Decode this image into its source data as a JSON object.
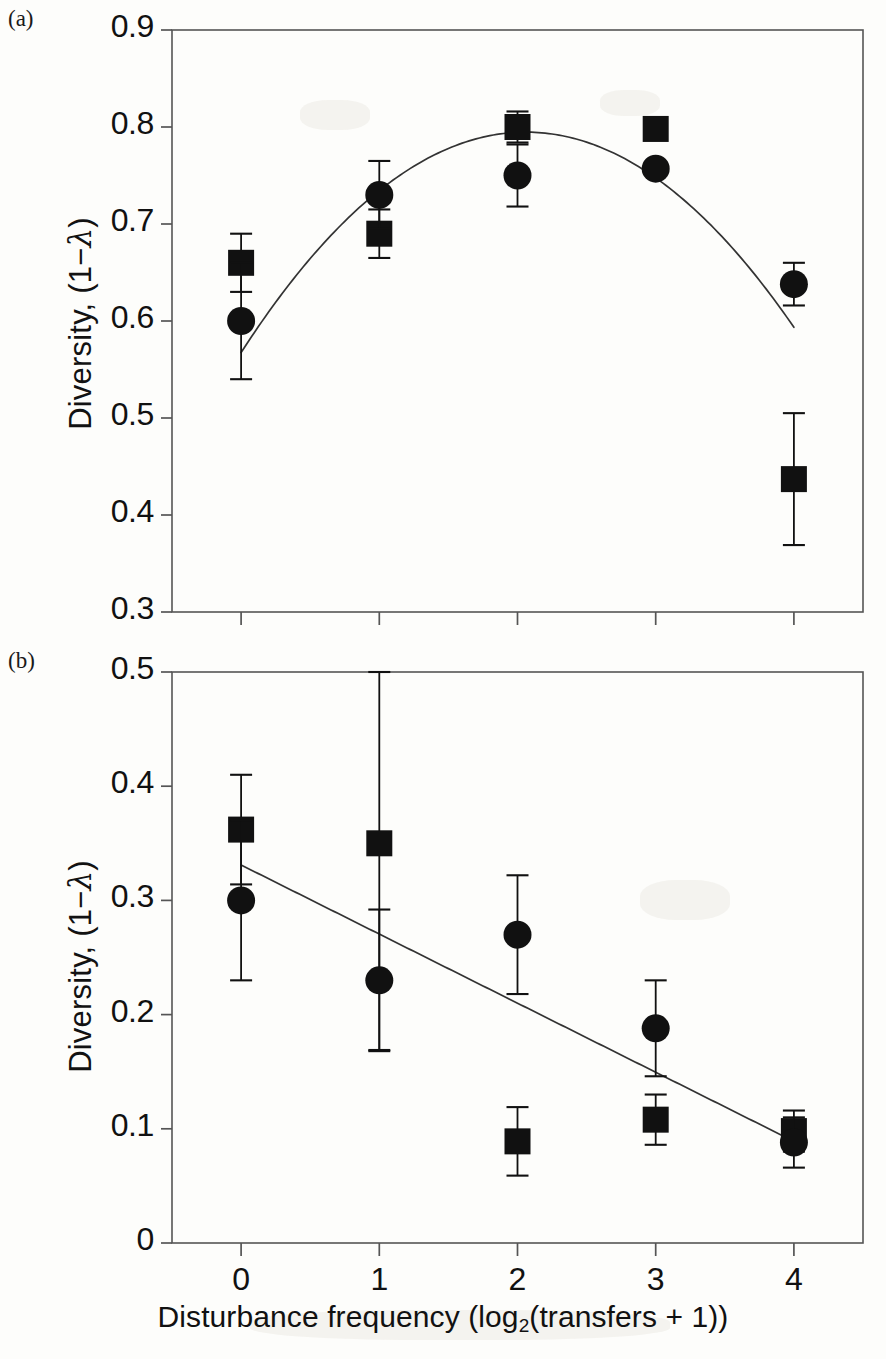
{
  "figure": {
    "panel_a_tag": "(a)",
    "panel_b_tag": "(b)",
    "xlabel_prefix": "Disturbance frequency (log",
    "xlabel_sub": "2",
    "xlabel_suffix": "(transfers + 1))",
    "ylabel_prefix": "Diversity, (1−",
    "ylabel_lambda": "λ",
    "ylabel_suffix": ")",
    "marker_colors": {
      "ink": "#111111",
      "axis": "#555555",
      "fit": "#333333"
    }
  },
  "chart_data": [
    {
      "type": "scatter",
      "panel": "(a)",
      "title": "",
      "xlabel": "Disturbance frequency (log2(transfers + 1))",
      "ylabel": "Diversity, (1−λ)",
      "xlim": [
        -0.5,
        4.5
      ],
      "ylim": [
        0.3,
        0.9
      ],
      "xticks": [
        0,
        1,
        2,
        3,
        4
      ],
      "xtick_labels": [
        "0",
        "1",
        "2",
        "3",
        "4"
      ],
      "yticks": [
        0.3,
        0.4,
        0.5,
        0.6,
        0.7,
        0.8,
        0.9
      ],
      "ytick_labels": [
        "0.3",
        "0.4",
        "0.5",
        "0.6",
        "0.7",
        "0.8",
        "0.9"
      ],
      "grid": false,
      "legend": "none",
      "x": [
        0,
        1,
        2,
        3,
        4
      ],
      "series": [
        {
          "name": "square",
          "marker": "square",
          "values": [
            0.66,
            0.69,
            0.8,
            0.798,
            0.437
          ],
          "err": [
            0.03,
            0.025,
            0.016,
            0.006,
            0.068
          ]
        },
        {
          "name": "circle",
          "marker": "circle",
          "values": [
            0.6,
            0.73,
            0.75,
            0.757,
            0.638
          ],
          "err": [
            0.06,
            0.035,
            0.032,
            0.006,
            0.022
          ]
        }
      ],
      "fit": {
        "kind": "quadratic",
        "equation": "y = 0.5675 + 0.2205x - 0.0535x^2",
        "a": -0.0535,
        "b": 0.2205,
        "c": 0.5675,
        "x_start": 0.0,
        "x_end": 4.0
      }
    },
    {
      "type": "scatter",
      "panel": "(b)",
      "title": "",
      "xlabel": "Disturbance frequency (log2(transfers + 1))",
      "ylabel": "Diversity, (1−λ)",
      "xlim": [
        -0.5,
        4.5
      ],
      "ylim": [
        0.0,
        0.5
      ],
      "xticks": [
        0,
        1,
        2,
        3,
        4
      ],
      "xtick_labels": [
        "0",
        "1",
        "2",
        "3",
        "4"
      ],
      "yticks": [
        0.0,
        0.1,
        0.2,
        0.3,
        0.4,
        0.5
      ],
      "ytick_labels": [
        "0",
        "0.1",
        "0.2",
        "0.3",
        "0.4",
        "0.5"
      ],
      "grid": false,
      "legend": "none",
      "x": [
        0,
        1,
        2,
        3,
        4
      ],
      "series": [
        {
          "name": "square",
          "marker": "square",
          "values": [
            0.362,
            0.35,
            0.089,
            0.108,
            0.098
          ],
          "err": [
            0.048,
            0.181,
            0.03,
            0.022,
            0.018
          ]
        },
        {
          "name": "circle",
          "marker": "circle",
          "values": [
            0.3,
            0.23,
            0.27,
            0.188,
            0.088
          ],
          "err": [
            0.07,
            0.062,
            0.052,
            0.042,
            0.022
          ]
        }
      ],
      "fit": {
        "kind": "linear",
        "equation": "y = 0.331 - 0.0605x",
        "slope": -0.0605,
        "intercept": 0.331,
        "x_start": 0.0,
        "x_end": 4.0
      }
    }
  ],
  "layout": {
    "panel_a": {
      "left": 172,
      "right": 863,
      "top": 30,
      "bottom": 612
    },
    "panel_b": {
      "left": 172,
      "right": 863,
      "top": 672,
      "bottom": 1243
    }
  }
}
